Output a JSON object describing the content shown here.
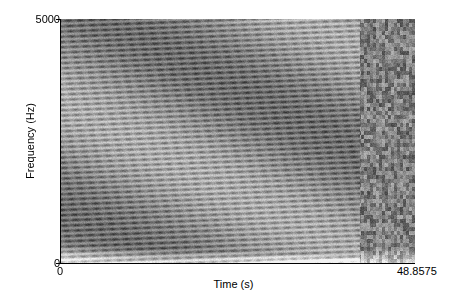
{
  "chart_data": {
    "type": "heatmap",
    "subtype": "spectrogram",
    "title": "",
    "xlabel": "Time (s)",
    "ylabel": "Frequency (Hz)",
    "xlim": [
      0,
      48.8575
    ],
    "ylim": [
      0,
      5000
    ],
    "x_ticks": [
      "0",
      "48.8575"
    ],
    "y_ticks": [
      "0",
      "5000"
    ],
    "colormap": "grayscale (dark = high energy)",
    "grid": false,
    "legend": null,
    "features": {
      "harmonic_section": {
        "t_start": 0,
        "t_end": 41.3,
        "description": "dense horizontal harmonic bands with regular periodic modulation, bands rise slightly over time"
      },
      "band_spacing_hz": 108,
      "band_rise_hz_over_section": 230,
      "modulation_period_s": 1.6,
      "noise_section": {
        "t_start": 41.3,
        "t_end": 48.8575,
        "description": "broadband noisy energy, darker and irregular"
      },
      "low_freq_light_region": {
        "f_max_hz": 350,
        "description": "light area near 0 Hz that thins out over time"
      }
    }
  },
  "axes": {
    "y_top_tick": "5000",
    "y_bottom_tick": "0",
    "x_left_tick": "0",
    "x_right_tick": "48.8575",
    "x_label": "Time (s)",
    "y_label": "Frequency (Hz)"
  },
  "colors": {
    "background": "#ffffff",
    "axis": "#000000",
    "dark": "#2a2a2a",
    "light": "#f2f2f2"
  }
}
